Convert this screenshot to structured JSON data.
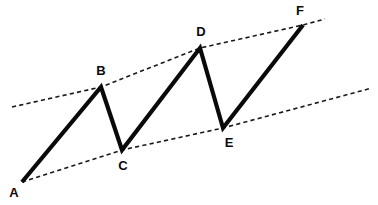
{
  "figure": {
    "background_color": "#ffffff",
    "stroke_color": "#0a0a0a",
    "trendline_color": "#1a1a1a",
    "label_color": "#0a0a0a",
    "width": 378,
    "height": 205
  },
  "chart_data": {
    "type": "line",
    "xlabel": "",
    "ylabel": "",
    "grid": false,
    "legend": "none",
    "axis_shown": false,
    "xlim": [
      0,
      378
    ],
    "ylim": [
      205,
      0
    ],
    "note": "Coordinates are in screen pixel space; y increases downward.",
    "series": [
      {
        "name": "price-zigzag",
        "style": "solid",
        "line_width": 4.2,
        "color": "#0a0a0a",
        "points": [
          {
            "label": "A",
            "x": 22,
            "y": 182
          },
          {
            "label": "B",
            "x": 101,
            "y": 87
          },
          {
            "label": "C",
            "x": 122,
            "y": 150
          },
          {
            "label": "D",
            "x": 200,
            "y": 48
          },
          {
            "label": "E",
            "x": 223,
            "y": 128
          },
          {
            "label": "F",
            "x": 303,
            "y": 25
          }
        ]
      },
      {
        "name": "upper-resistance-trendline",
        "style": "dashed",
        "line_width": 1.6,
        "color": "#1a1a1a",
        "passes_through": [
          "B",
          "D",
          "F"
        ],
        "points": [
          {
            "x": 12,
            "y": 107
          },
          {
            "x": 101,
            "y": 87
          },
          {
            "x": 200,
            "y": 48
          },
          {
            "x": 303,
            "y": 25
          },
          {
            "x": 325,
            "y": 19
          }
        ]
      },
      {
        "name": "lower-support-trendline",
        "style": "dashed",
        "line_width": 1.6,
        "color": "#1a1a1a",
        "passes_through": [
          "A",
          "C",
          "E"
        ],
        "points": [
          {
            "x": 22,
            "y": 182
          },
          {
            "x": 122,
            "y": 150
          },
          {
            "x": 223,
            "y": 128
          },
          {
            "x": 372,
            "y": 88
          }
        ]
      }
    ],
    "vertex_labels": [
      {
        "text": "A",
        "x": 14,
        "y": 197,
        "anchor": "middle"
      },
      {
        "text": "B",
        "x": 101,
        "y": 75,
        "anchor": "middle"
      },
      {
        "text": "C",
        "x": 123,
        "y": 170,
        "anchor": "middle"
      },
      {
        "text": "D",
        "x": 201,
        "y": 36,
        "anchor": "middle"
      },
      {
        "text": "E",
        "x": 229,
        "y": 147,
        "anchor": "middle"
      },
      {
        "text": "F",
        "x": 300,
        "y": 15,
        "anchor": "middle"
      }
    ]
  }
}
